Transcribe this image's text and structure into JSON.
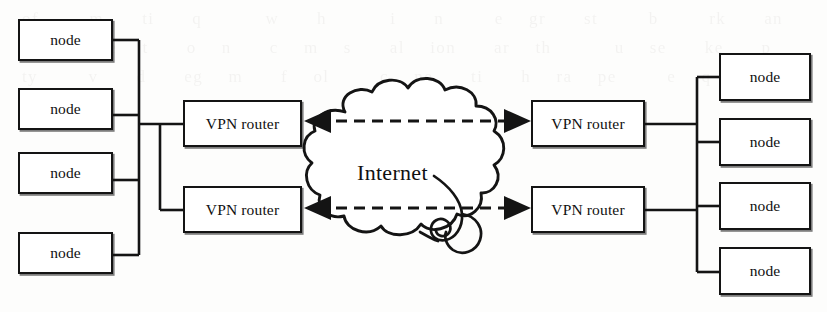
{
  "diagram": {
    "type": "network-topology",
    "background_artifact": "faint show-through text from reverse side of scanned page",
    "cloud": {
      "label": "Internet",
      "decoration": "spiral-curl-bottom-right"
    },
    "left_site": {
      "bus_label": "",
      "nodes": [
        {
          "label": "node"
        },
        {
          "label": "node"
        },
        {
          "label": "node"
        },
        {
          "label": "node"
        }
      ],
      "routers": [
        {
          "label": "VPN router"
        },
        {
          "label": "VPN router"
        }
      ]
    },
    "right_site": {
      "nodes": [
        {
          "label": "node"
        },
        {
          "label": "node"
        },
        {
          "label": "node"
        },
        {
          "label": "node"
        }
      ],
      "routers": [
        {
          "label": "VPN router"
        },
        {
          "label": "VPN router"
        }
      ]
    },
    "tunnels": [
      {
        "style": "dashed",
        "arrows": "both-ends",
        "from": "left VPN router 1",
        "to": "right VPN router 1"
      },
      {
        "style": "dashed",
        "arrows": "both-ends",
        "from": "left VPN router 2",
        "to": "right VPN router 2"
      }
    ],
    "colors": {
      "ink": "#141414",
      "paper": "#fdfdfc",
      "box_fill": "#ffffff"
    }
  },
  "ghost_text": "of    m   ti   q     w   h     i   n    e  gr   st    b    rk   an   pl     re  t   o  n   c  m  s   al  ion   ar  th     u  se   ke   p  ty    v   d   eg  m   f  ol    c  ne   ti   h  ra  pe    e  q   w"
}
